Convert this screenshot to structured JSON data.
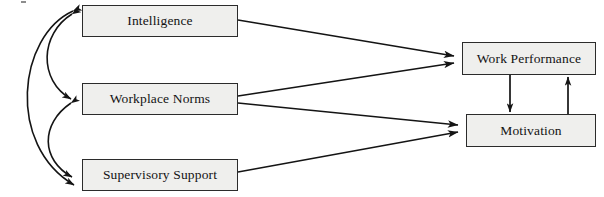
{
  "diagram": {
    "type": "path-model",
    "title": "",
    "canvas": {
      "width": 604,
      "height": 197,
      "background": "#ffffff"
    },
    "style": {
      "node_fill": "#efefed",
      "node_stroke": "#2b2b2b",
      "edge_color": "#141414",
      "text_color": "#131313"
    },
    "nodes": [
      {
        "id": "intelligence",
        "label": "Intelligence",
        "role": "predictor",
        "x": 82,
        "y": 5,
        "width": 156,
        "height": 32
      },
      {
        "id": "workplace-norms",
        "label": "Workplace Norms",
        "role": "predictor",
        "x": 82,
        "y": 83,
        "width": 156,
        "height": 32
      },
      {
        "id": "supervisory-support",
        "label": "Supervisory Support",
        "role": "predictor",
        "x": 82,
        "y": 159,
        "width": 156,
        "height": 32
      },
      {
        "id": "work-performance",
        "label": "Work Performance",
        "role": "outcome",
        "x": 462,
        "y": 42,
        "width": 134,
        "height": 33
      },
      {
        "id": "motivation",
        "label": "Motivation",
        "role": "outcome",
        "x": 466,
        "y": 114,
        "width": 130,
        "height": 33
      }
    ],
    "edges": [
      {
        "id": "intelligence-to-work-performance",
        "from": "intelligence",
        "to": "work-performance",
        "kind": "directed",
        "shape": "straight"
      },
      {
        "id": "workplace-norms-to-work-performance",
        "from": "workplace-norms",
        "to": "work-performance",
        "kind": "directed",
        "shape": "straight"
      },
      {
        "id": "workplace-norms-to-motivation",
        "from": "workplace-norms",
        "to": "motivation",
        "kind": "directed",
        "shape": "straight"
      },
      {
        "id": "supervisory-support-to-motivation",
        "from": "supervisory-support",
        "to": "motivation",
        "kind": "directed",
        "shape": "straight"
      },
      {
        "id": "work-performance-to-motivation",
        "from": "work-performance",
        "to": "motivation",
        "kind": "directed",
        "shape": "vertical"
      },
      {
        "id": "motivation-to-work-performance",
        "from": "motivation",
        "to": "work-performance",
        "kind": "directed",
        "shape": "vertical"
      },
      {
        "id": "intelligence-workplace-norms-covariance",
        "from": "intelligence",
        "to": "workplace-norms",
        "kind": "bidirectional",
        "shape": "curved"
      },
      {
        "id": "workplace-norms-supervisory-support-covariance",
        "from": "workplace-norms",
        "to": "supervisory-support",
        "kind": "bidirectional",
        "shape": "curved"
      },
      {
        "id": "intelligence-supervisory-support-covariance",
        "from": "intelligence",
        "to": "supervisory-support",
        "kind": "bidirectional",
        "shape": "curved"
      }
    ]
  }
}
